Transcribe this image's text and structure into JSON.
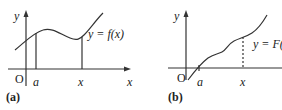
{
  "panel_a": {
    "caption": "(a)",
    "y_axis": "y",
    "x_axis": "x",
    "origin": "O",
    "tick_a": "a",
    "tick_x": "x",
    "curve_label": "y = f(x)"
  },
  "panel_b": {
    "caption": "(b)",
    "y_axis": "y",
    "origin": "O",
    "tick_a": "a",
    "tick_x": "x",
    "curve_label": "y = F(x)"
  },
  "colors": {
    "ink": "#333333"
  }
}
